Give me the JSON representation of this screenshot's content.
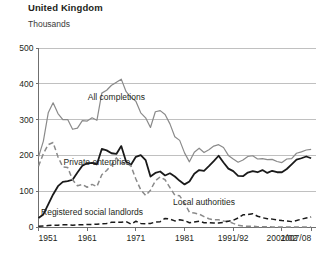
{
  "chart_data": {
    "type": "line",
    "title": "United Kingdom",
    "subtitle": "Thousands",
    "xlabel": "",
    "ylabel": "Thousands",
    "ylim": [
      0,
      500
    ],
    "xlim": [
      1951,
      2008
    ],
    "grid": true,
    "legend_position": "inline-annotations",
    "ytick_labels": [
      "0",
      "100",
      "200",
      "300",
      "400",
      "500"
    ],
    "ytick_values": [
      0,
      100,
      200,
      300,
      400,
      500
    ],
    "xtick_labels": [
      "1951",
      "1961",
      "1971",
      "1981",
      "1991/92",
      "2001/02",
      "2007/08"
    ],
    "xtick_values": [
      1951,
      1961,
      1971,
      1981,
      1991,
      2001,
      2007
    ],
    "colors": {
      "all_completions": "#8a8a8a",
      "private_enterprise": "#1a1a1a",
      "local_authorities": "#8a8a8a",
      "registered_social_landlords": "#1a1a1a",
      "gridline": "#b9b9b9",
      "axis": "#6f6f6f",
      "background": "#ffffff"
    },
    "series": [
      {
        "name": "All completions",
        "style": "solid",
        "color": "#8a8a8a",
        "label_x": 1967,
        "label_y": 355,
        "x": [
          1951,
          1952,
          1953,
          1954,
          1955,
          1956,
          1957,
          1958,
          1959,
          1960,
          1961,
          1962,
          1963,
          1964,
          1965,
          1966,
          1967,
          1968,
          1969,
          1970,
          1971,
          1972,
          1973,
          1974,
          1975,
          1976,
          1977,
          1978,
          1979,
          1980,
          1981,
          1982,
          1983,
          1984,
          1985,
          1986,
          1987,
          1988,
          1989,
          1990,
          1991,
          1992,
          1993,
          1994,
          1995,
          1996,
          1997,
          1998,
          1999,
          2000,
          2001,
          2002,
          2003,
          2004,
          2005,
          2006,
          2007
        ],
        "values": [
          195,
          240,
          319,
          347,
          317,
          300,
          300,
          273,
          276,
          297,
          296,
          305,
          298,
          374,
          382,
          396,
          404,
          413,
          378,
          362,
          351,
          319,
          305,
          278,
          322,
          325,
          314,
          288,
          252,
          242,
          207,
          182,
          209,
          220,
          208,
          216,
          226,
          230,
          222,
          200,
          190,
          181,
          187,
          197,
          199,
          190,
          191,
          188,
          189,
          183,
          180,
          190,
          191,
          206,
          210,
          215,
          217
        ]
      },
      {
        "name": "Private enterprise",
        "style": "solid",
        "color": "#1a1a1a",
        "label_x": 1963,
        "label_y": 172,
        "x": [
          1951,
          1952,
          1953,
          1954,
          1955,
          1956,
          1957,
          1958,
          1959,
          1960,
          1961,
          1962,
          1963,
          1964,
          1965,
          1966,
          1967,
          1968,
          1969,
          1970,
          1971,
          1972,
          1973,
          1974,
          1975,
          1976,
          1977,
          1978,
          1979,
          1980,
          1981,
          1982,
          1983,
          1984,
          1985,
          1986,
          1987,
          1988,
          1989,
          1990,
          1991,
          1992,
          1993,
          1994,
          1995,
          1996,
          1997,
          1998,
          1999,
          2000,
          2001,
          2002,
          2003,
          2004,
          2005,
          2006,
          2007
        ],
        "values": [
          25,
          35,
          63,
          91,
          114,
          126,
          128,
          132,
          152,
          171,
          178,
          179,
          175,
          218,
          214,
          206,
          204,
          226,
          182,
          174,
          196,
          201,
          187,
          141,
          151,
          155,
          144,
          150,
          141,
          129,
          119,
          127,
          149,
          159,
          157,
          170,
          184,
          199,
          180,
          163,
          156,
          143,
          142,
          152,
          156,
          153,
          159,
          151,
          157,
          153,
          153,
          162,
          175,
          188,
          192,
          197,
          192
        ]
      },
      {
        "name": "Local authorities",
        "style": "dashed",
        "color": "#8a8a8a",
        "label_x": 1985,
        "label_y": 62,
        "x": [
          1951,
          1952,
          1953,
          1954,
          1955,
          1956,
          1957,
          1958,
          1959,
          1960,
          1961,
          1962,
          1963,
          1964,
          1965,
          1966,
          1967,
          1968,
          1969,
          1970,
          1971,
          1972,
          1973,
          1974,
          1975,
          1976,
          1977,
          1978,
          1979,
          1980,
          1981,
          1982,
          1983,
          1984,
          1985,
          1986,
          1987,
          1988,
          1989,
          1990,
          1991,
          1992,
          1993,
          1994,
          1995,
          1996,
          1997,
          1998,
          1999,
          2000,
          2001,
          2002,
          2003,
          2004,
          2005,
          2006,
          2007
        ],
        "values": [
          170,
          205,
          230,
          236,
          196,
          168,
          166,
          132,
          115,
          119,
          111,
          119,
          113,
          146,
          158,
          174,
          193,
          178,
          180,
          170,
          134,
          104,
          88,
          103,
          129,
          140,
          132,
          110,
          89,
          87,
          67,
          41,
          39,
          36,
          29,
          23,
          20,
          20,
          17,
          16,
          10,
          5,
          3,
          2,
          2,
          1,
          1,
          1,
          0,
          0,
          0,
          0,
          0,
          0,
          0,
          0,
          0
        ]
      },
      {
        "name": "Registered social landlords",
        "style": "dashed",
        "color": "#1a1a1a",
        "label_x": 1962,
        "label_y": 34,
        "x": [
          1951,
          1952,
          1953,
          1954,
          1955,
          1956,
          1957,
          1958,
          1959,
          1960,
          1961,
          1962,
          1963,
          1964,
          1965,
          1966,
          1967,
          1968,
          1969,
          1970,
          1971,
          1972,
          1973,
          1974,
          1975,
          1976,
          1977,
          1978,
          1979,
          1980,
          1981,
          1982,
          1983,
          1984,
          1985,
          1986,
          1987,
          1988,
          1989,
          1990,
          1991,
          1992,
          1993,
          1994,
          1995,
          1996,
          1997,
          1998,
          1999,
          2000,
          2001,
          2002,
          2003,
          2004,
          2005,
          2006,
          2007
        ],
        "values": [
          2,
          3,
          4,
          5,
          5,
          6,
          6,
          5,
          6,
          6,
          7,
          7,
          8,
          9,
          10,
          13,
          13,
          13,
          15,
          8,
          16,
          10,
          9,
          10,
          14,
          15,
          24,
          22,
          17,
          20,
          18,
          12,
          14,
          16,
          12,
          12,
          11,
          11,
          13,
          16,
          19,
          25,
          34,
          35,
          37,
          30,
          26,
          23,
          22,
          20,
          18,
          17,
          15,
          18,
          22,
          25,
          28
        ]
      }
    ],
    "annotations": [
      {
        "text": "All completions",
        "series": "All completions"
      },
      {
        "text": "Private enterprise",
        "series": "Private enterprise"
      },
      {
        "text": "Local authorities",
        "series": "Local authorities"
      },
      {
        "text": "Registered social landlords",
        "series": "Registered social landlords"
      }
    ]
  }
}
